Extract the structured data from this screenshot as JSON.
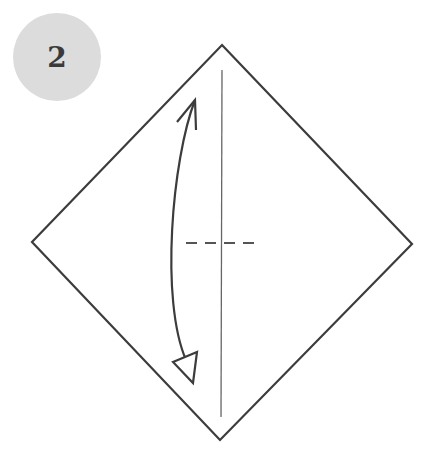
{
  "step": {
    "number": "2",
    "badge_color": "#dcdcdc",
    "number_color": "#3a3a3a"
  },
  "diagram": {
    "paper_edge_color": "#3c3c3c",
    "crease_color": "#555555",
    "elements": [
      {
        "type": "diamond-paper",
        "label": "paper"
      },
      {
        "type": "vertical-crease",
        "label": "existing crease line"
      },
      {
        "type": "valley-fold-line",
        "label": "dashed horizontal fold line"
      },
      {
        "type": "fold-unfold-arrow",
        "label": "double-headed curved arrow"
      }
    ]
  }
}
